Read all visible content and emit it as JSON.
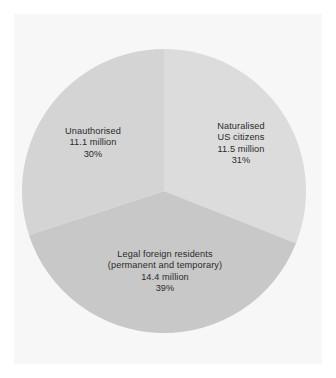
{
  "figure": {
    "background_color": "#ffffff",
    "panel_color": "#f7f7f7",
    "label_text_color": "#2b2b2b"
  },
  "chart_data": {
    "type": "pie",
    "title": "",
    "subtitle": "",
    "xlabel": "",
    "ylabel": "",
    "legend": "none",
    "grid": false,
    "units": "million",
    "start_angle_deg": 0,
    "direction": "clockwise",
    "center": {
      "cx": 164,
      "cy": 191,
      "r": 142
    },
    "categories": [
      "Naturalised US citizens",
      "Legal foreign residents (permanent and temporary)",
      "Unauthorised"
    ],
    "values": [
      11.5,
      14.4,
      11.1
    ],
    "percentages": [
      31,
      39,
      30
    ],
    "colors": [
      "#dcdcdc",
      "#c8c8c8",
      "#d4d4d4"
    ],
    "slices": [
      {
        "key": "naturalised",
        "name": "Naturalised US citizens",
        "value": 11.5,
        "percent": 31,
        "color": "#dcdcdc",
        "start_angle_deg": 0,
        "end_angle_deg": 111.6,
        "label_lines": [
          "Naturalised",
          "US citizens",
          "11.5 million",
          "31%"
        ]
      },
      {
        "key": "legal",
        "name": "Legal foreign residents (permanent and temporary)",
        "value": 14.4,
        "percent": 39,
        "color": "#c8c8c8",
        "start_angle_deg": 111.6,
        "end_angle_deg": 252.0,
        "label_lines": [
          "Legal foreign residents",
          "(permanent and temporary)",
          "14.4 million",
          "39%"
        ]
      },
      {
        "key": "unauthorised",
        "name": "Unauthorised",
        "value": 11.1,
        "percent": 30,
        "color": "#d4d4d4",
        "start_angle_deg": 252.0,
        "end_angle_deg": 360.0,
        "label_lines": [
          "Unauthorised",
          "11.1 million",
          "30%"
        ]
      }
    ]
  },
  "labels": {
    "naturalised": {
      "line1": "Naturalised",
      "line2": "US citizens",
      "line3": "11.5 million",
      "line4": "31%"
    },
    "legal": {
      "line1": "Legal foreign residents",
      "line2": "(permanent and temporary)",
      "line3": "14.4 million",
      "line4": "39%"
    },
    "unauthorised": {
      "line1": "Unauthorised",
      "line2": "11.1 million",
      "line3": "30%"
    }
  }
}
